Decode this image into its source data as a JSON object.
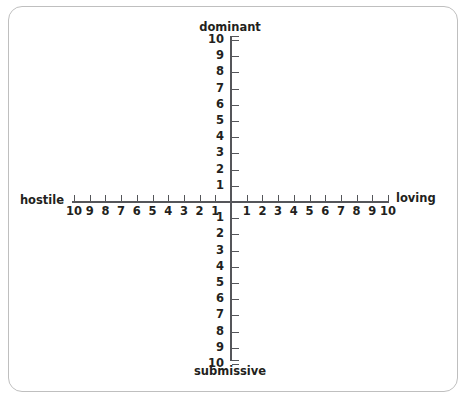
{
  "chart_data": {
    "type": "scatter",
    "title": "",
    "subtitle": "",
    "grid": false,
    "legend": null,
    "axes": {
      "vertical": {
        "name": "dominance-submission",
        "pole_high": "dominant",
        "pole_low": "submissive",
        "ticks_upper": [
          "10",
          "9",
          "8",
          "7",
          "6",
          "5",
          "4",
          "3",
          "2",
          "1"
        ],
        "ticks_lower": [
          "1",
          "2",
          "3",
          "4",
          "5",
          "6",
          "7",
          "8",
          "9",
          "10"
        ],
        "range": [
          -10,
          10
        ],
        "tick_label_side": "left",
        "tick_mark_side": "right"
      },
      "horizontal": {
        "name": "hostile-loving",
        "pole_low": "hostile",
        "pole_high": "loving",
        "ticks_left": [
          "10",
          "9",
          "8",
          "7",
          "6",
          "5",
          "4",
          "3",
          "2",
          "1"
        ],
        "ticks_right": [
          "1",
          "2",
          "3",
          "4",
          "5",
          "6",
          "7",
          "8",
          "9",
          "10"
        ],
        "range": [
          -10,
          10
        ],
        "tick_label_side": "below",
        "tick_mark_side": "above"
      }
    },
    "series": [],
    "values": [],
    "colors": {
      "axis": "#55565a",
      "text": "#231f20",
      "border": "#bfbfbf",
      "background": "#ffffff"
    }
  },
  "labels": {
    "dominant": "dominant",
    "submissive": "submissive",
    "hostile": "hostile",
    "loving": "loving"
  }
}
